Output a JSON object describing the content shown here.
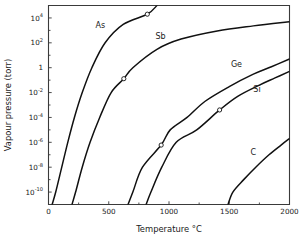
{
  "chart_data": {
    "type": "line",
    "title": "",
    "xlabel": "Temperature °C",
    "ylabel": "Vapour pressure (torr)",
    "xlim": [
      0,
      2000
    ],
    "ylim": [
      1e-11,
      100000.0
    ],
    "yscale": "log",
    "xscale": "linear",
    "grid": false,
    "legend_position": "inline-annotations",
    "xticks": [
      0,
      500,
      1000,
      1500,
      2000
    ],
    "xtick_labels": [
      "0",
      "500",
      "1000",
      "1500",
      "2000"
    ],
    "yticks": [
      10000,
      100,
      1,
      0.01,
      0.0001,
      1e-06,
      1e-08,
      1e-10
    ],
    "ytick_labels": [
      {
        "base": "10",
        "exp": "4"
      },
      {
        "base": "10",
        "exp": "2"
      },
      {
        "base": "1",
        "exp": ""
      },
      {
        "base": "10",
        "exp": "-2"
      },
      {
        "base": "10",
        "exp": "-4"
      },
      {
        "base": "10",
        "exp": "-6"
      },
      {
        "base": "10",
        "exp": "-8"
      },
      {
        "base": "10",
        "exp": "-10"
      }
    ],
    "series": [
      {
        "name": "As",
        "label": "As",
        "label_x": 430,
        "label_y": 1500,
        "marker_point": {
          "x": 820,
          "y": 20000
        },
        "points": [
          {
            "x": 30,
            "y": 1e-11
          },
          {
            "x": 60,
            "y": 1e-10
          },
          {
            "x": 110,
            "y": 1e-08
          },
          {
            "x": 160,
            "y": 1e-06
          },
          {
            "x": 215,
            "y": 0.0001
          },
          {
            "x": 280,
            "y": 0.01
          },
          {
            "x": 360,
            "y": 1
          },
          {
            "x": 470,
            "y": 100
          },
          {
            "x": 620,
            "y": 3000
          },
          {
            "x": 820,
            "y": 20000
          },
          {
            "x": 900,
            "y": 100000
          }
        ]
      },
      {
        "name": "Sb",
        "label": "Sb",
        "label_x": 930,
        "label_y": 200,
        "marker_point": {
          "x": 625,
          "y": 0.13
        },
        "points": [
          {
            "x": 195,
            "y": 1e-11
          },
          {
            "x": 225,
            "y": 1e-10
          },
          {
            "x": 280,
            "y": 1e-08
          },
          {
            "x": 345,
            "y": 1e-06
          },
          {
            "x": 425,
            "y": 0.0001
          },
          {
            "x": 520,
            "y": 0.01
          },
          {
            "x": 625,
            "y": 0.13
          },
          {
            "x": 700,
            "y": 1
          },
          {
            "x": 900,
            "y": 30
          },
          {
            "x": 1100,
            "y": 200
          },
          {
            "x": 1400,
            "y": 900
          },
          {
            "x": 1700,
            "y": 2300
          },
          {
            "x": 2000,
            "y": 5000
          }
        ]
      },
      {
        "name": "Ge",
        "label": "Ge",
        "label_x": 1560,
        "label_y": 1.2,
        "marker_point": {
          "x": 935,
          "y": 6e-07
        },
        "points": [
          {
            "x": 660,
            "y": 1e-11
          },
          {
            "x": 700,
            "y": 1e-10
          },
          {
            "x": 780,
            "y": 1e-08
          },
          {
            "x": 935,
            "y": 6e-07
          },
          {
            "x": 1010,
            "y": 1e-05
          },
          {
            "x": 1150,
            "y": 0.0001
          },
          {
            "x": 1300,
            "y": 0.002
          },
          {
            "x": 1500,
            "y": 0.03
          },
          {
            "x": 1700,
            "y": 0.3
          },
          {
            "x": 1850,
            "y": 1.2
          },
          {
            "x": 2000,
            "y": 5
          }
        ]
      },
      {
        "name": "Si",
        "label": "Si",
        "label_x": 1730,
        "label_y": 0.012,
        "marker_point": {
          "x": 1420,
          "y": 0.0004
        },
        "points": [
          {
            "x": 810,
            "y": 1e-11
          },
          {
            "x": 850,
            "y": 1e-10
          },
          {
            "x": 940,
            "y": 1e-08
          },
          {
            "x": 1060,
            "y": 1e-06
          },
          {
            "x": 1230,
            "y": 1e-05
          },
          {
            "x": 1420,
            "y": 0.0004
          },
          {
            "x": 1570,
            "y": 0.005
          },
          {
            "x": 1750,
            "y": 0.04
          },
          {
            "x": 1880,
            "y": 0.15
          },
          {
            "x": 2000,
            "y": 0.5
          }
        ]
      },
      {
        "name": "C",
        "label": "C",
        "label_x": 1700,
        "label_y": 9e-08,
        "marker_point": null,
        "points": [
          {
            "x": 1490,
            "y": 1e-11
          },
          {
            "x": 1530,
            "y": 1e-10
          },
          {
            "x": 1620,
            "y": 1e-09
          },
          {
            "x": 1720,
            "y": 1e-08
          },
          {
            "x": 1830,
            "y": 1e-07
          },
          {
            "x": 1930,
            "y": 6e-07
          },
          {
            "x": 2000,
            "y": 2e-06
          }
        ]
      }
    ]
  },
  "axes": {
    "x_title": "Temperature °C",
    "y_title": "Vapour pressure (torr)"
  }
}
